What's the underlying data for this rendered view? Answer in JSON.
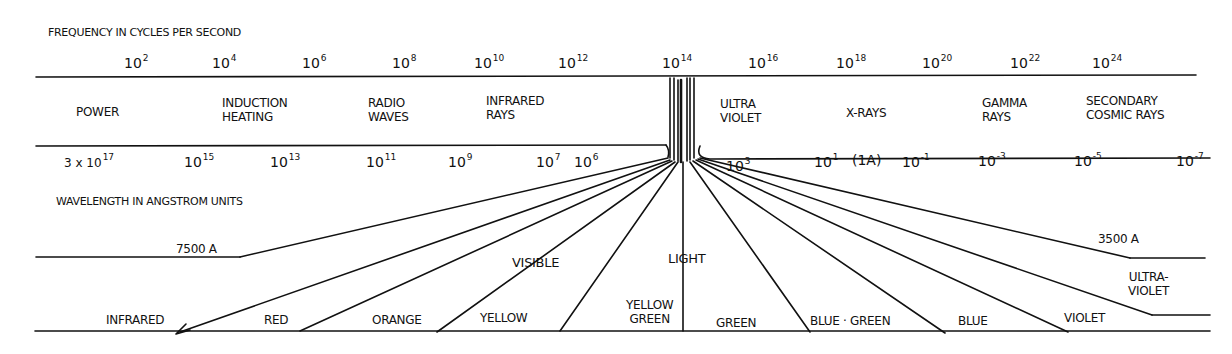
{
  "frequency_axis": {
    "title": "FREQUENCY IN CYCLES PER SECOND",
    "ticks": [
      {
        "base": "10",
        "exp": "2"
      },
      {
        "base": "10",
        "exp": "4"
      },
      {
        "base": "10",
        "exp": "6"
      },
      {
        "base": "10",
        "exp": "8"
      },
      {
        "base": "10",
        "exp": "10"
      },
      {
        "base": "10",
        "exp": "12"
      },
      {
        "base": "10",
        "exp": "14"
      },
      {
        "base": "10",
        "exp": "16"
      },
      {
        "base": "10",
        "exp": "18"
      },
      {
        "base": "10",
        "exp": "20"
      },
      {
        "base": "10",
        "exp": "22"
      },
      {
        "base": "10",
        "exp": "24"
      }
    ]
  },
  "bands": [
    {
      "line1": "POWER",
      "line2": ""
    },
    {
      "line1": "INDUCTION",
      "line2": "HEATING"
    },
    {
      "line1": "RADIO",
      "line2": "WAVES"
    },
    {
      "line1": "INFRARED",
      "line2": "RAYS"
    },
    {
      "line1": "ULTRA",
      "line2": "VIOLET"
    },
    {
      "line1": "X-RAYS",
      "line2": ""
    },
    {
      "line1": "GAMMA",
      "line2": "RAYS"
    },
    {
      "line1": "SECONDARY",
      "line2": "COSMIC RAYS"
    }
  ],
  "wavelength_axis": {
    "title": "WAVELENGTH IN ANGSTROM UNITS",
    "ticks": [
      {
        "base": "3 x 10",
        "exp": "17"
      },
      {
        "base": "10",
        "exp": "15"
      },
      {
        "base": "10",
        "exp": "13"
      },
      {
        "base": "10",
        "exp": "11"
      },
      {
        "base": "10",
        "exp": "9"
      },
      {
        "base": "10",
        "exp": "7"
      },
      {
        "base": "10",
        "exp": "6"
      },
      {
        "base": "10",
        "exp": "3"
      },
      {
        "base": "10",
        "exp": "1"
      },
      {
        "base": "(1A)",
        "exp": ""
      },
      {
        "base": "10",
        "exp": "-1"
      },
      {
        "base": "10",
        "exp": "-3"
      },
      {
        "base": "10",
        "exp": "-5"
      },
      {
        "base": "10",
        "exp": "-7"
      }
    ]
  },
  "visible_light": {
    "label_left": "VISIBLE",
    "label_right": "LIGHT",
    "boundary_long": "7500 A",
    "boundary_short": "3500 A",
    "colors": [
      {
        "line1": "INFRARED",
        "line2": ""
      },
      {
        "line1": "RED",
        "line2": ""
      },
      {
        "line1": "ORANGE",
        "line2": ""
      },
      {
        "line1": "YELLOW",
        "line2": ""
      },
      {
        "line1": "YELLOW",
        "line2": "GREEN"
      },
      {
        "line1": "GREEN",
        "line2": ""
      },
      {
        "line1": "BLUE · GREEN",
        "line2": ""
      },
      {
        "line1": "BLUE",
        "line2": ""
      },
      {
        "line1": "VIOLET",
        "line2": ""
      },
      {
        "line1": "ULTRA-",
        "line2": "VIOLET"
      }
    ]
  }
}
